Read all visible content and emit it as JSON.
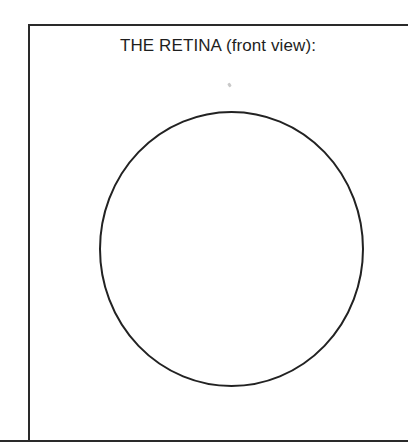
{
  "title": "THE RETINA (front view):",
  "diagram": {
    "shape": "circle-outline",
    "stroke_color": "#222222",
    "fill_color": "#ffffff"
  }
}
